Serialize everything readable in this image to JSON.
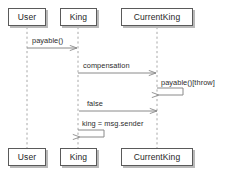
{
  "diagram": {
    "type": "uml-sequence-diagram",
    "title": "",
    "background_color": "#ffffff",
    "line_color": "#8a8a8a",
    "box_border_color": "#5a5a5a",
    "box_fill_color": "#ffffff",
    "shadow_color": "#b9b9b9",
    "text_color": "#262626"
  },
  "lifelines": [
    {
      "id": "user",
      "label": "User",
      "x": 27,
      "box_left": 8,
      "box_top": 8,
      "box_width": 38,
      "box_height": 18,
      "bottom_top": 148
    },
    {
      "id": "king",
      "label": "King",
      "x": 78,
      "box_left": 60,
      "box_top": 8,
      "box_width": 37,
      "box_height": 18,
      "bottom_top": 148
    },
    {
      "id": "currentking",
      "label": "CurrentKing",
      "x": 157,
      "box_left": 121,
      "box_top": 8,
      "box_width": 72,
      "box_height": 18,
      "bottom_top": 148
    }
  ],
  "messages": [
    {
      "id": "m1",
      "label": "payable()",
      "from": "user",
      "to": "king",
      "y": 48,
      "label_x": 32,
      "label_y": 37,
      "kind": "call",
      "direction": "right"
    },
    {
      "id": "m2",
      "label": "compensation",
      "from": "king",
      "to": "currentking",
      "y": 73,
      "label_x": 83,
      "label_y": 62,
      "kind": "call",
      "direction": "right"
    },
    {
      "id": "m3",
      "label": "payable()[throw]",
      "from": "currentking",
      "to": "currentking",
      "y": 93,
      "label_x": 161,
      "label_y": 81,
      "kind": "self",
      "direction": "self"
    },
    {
      "id": "m4",
      "label": "false",
      "from": "currentking",
      "to": "king",
      "y": 111,
      "label_x": 86,
      "label_y": 101,
      "kind": "return",
      "direction": "left"
    },
    {
      "id": "m5",
      "label": "king = msg.sender",
      "from": "king",
      "to": "king",
      "y": 136,
      "label_x": 82,
      "label_y": 122,
      "kind": "self",
      "direction": "self"
    }
  ]
}
